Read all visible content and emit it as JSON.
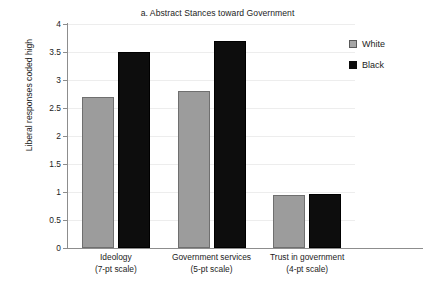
{
  "chart_data": {
    "type": "bar",
    "title": "a. Abstract Stances toward Government",
    "xlabel": "",
    "ylabel": "Liberal responses coded high",
    "ylim": [
      0,
      4
    ],
    "ytick_labels": [
      "0",
      "0.5",
      "1",
      "1.5",
      "2",
      "2.5",
      "3",
      "3.5",
      "4"
    ],
    "ytick_values": [
      0,
      0.5,
      1,
      1.5,
      2,
      2.5,
      3,
      3.5,
      4
    ],
    "grid": true,
    "legend_position": "right",
    "categories": [
      "Ideology",
      "Government services",
      "Trust in government"
    ],
    "category_sublabels": [
      "(7-pt scale)",
      "(5-pt scale)",
      "(4-pt scale)"
    ],
    "series": [
      {
        "name": "White",
        "color": "#9c9c9c",
        "values": [
          2.7,
          2.8,
          0.95
        ]
      },
      {
        "name": "Black",
        "color": "#0d0d0d",
        "values": [
          3.5,
          3.7,
          0.96
        ]
      }
    ]
  },
  "legend": {
    "items": [
      {
        "label": "White",
        "swatch": "gray-square-icon"
      },
      {
        "label": "Black",
        "swatch": "black-square-icon"
      }
    ]
  }
}
